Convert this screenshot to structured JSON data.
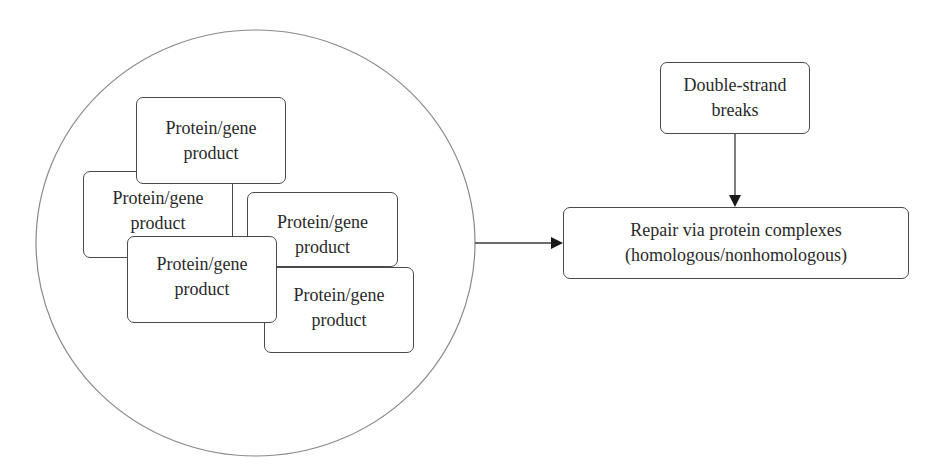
{
  "diagram": {
    "cluster": {
      "shape": "circle",
      "proteins": [
        {
          "id": "protein-a",
          "line1": "Protein/gene",
          "line2": "product"
        },
        {
          "id": "protein-b",
          "line1": "Protein/gene",
          "line2": "product"
        },
        {
          "id": "protein-c",
          "line1": "Protein/gene",
          "line2": "product"
        },
        {
          "id": "protein-d",
          "line1": "Protein/gene",
          "line2": "product"
        },
        {
          "id": "protein-e",
          "line1": "Protein/gene",
          "line2": "product"
        }
      ]
    },
    "trigger": {
      "line1": "Double-strand",
      "line2": "breaks"
    },
    "outcome": {
      "line1": "Repair via protein complexes",
      "line2": "(homologous/nonhomologous)"
    },
    "edges": [
      {
        "from": "cluster",
        "to": "outcome"
      },
      {
        "from": "trigger",
        "to": "outcome"
      }
    ],
    "colors": {
      "stroke": "#4a4a4a",
      "circle": "#8a8a8a",
      "text": "#2a2a2a",
      "background": "#ffffff"
    }
  }
}
